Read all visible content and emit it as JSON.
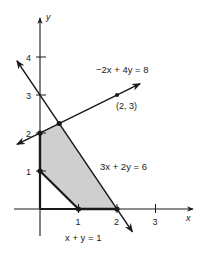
{
  "diagram": {
    "type": "linear-programming-feasible-region",
    "axes": {
      "x_label": "x",
      "y_label": "y",
      "x_range": [
        -0.6,
        3.6
      ],
      "y_range": [
        -1.0,
        5.0
      ],
      "x_ticks": [
        {
          "value": 1,
          "label": "1"
        },
        {
          "value": 2,
          "label": "2"
        },
        {
          "value": 3,
          "label": "3"
        }
      ],
      "y_ticks": [
        {
          "value": 1,
          "label": "1"
        },
        {
          "value": 2,
          "label": "2"
        },
        {
          "value": 3,
          "label": "3"
        },
        {
          "value": 4,
          "label": "4"
        }
      ]
    },
    "lines": [
      {
        "id": "line-neg2x-4y-8",
        "label": "−2x + 4y = 8",
        "a": -2,
        "b": 4,
        "c": 8,
        "from": [
          -0.6,
          1.7
        ],
        "to": [
          2.6,
          3.3
        ],
        "arrows": "both"
      },
      {
        "id": "line-3x-2y-6",
        "label": "3x + 2y = 6",
        "a": 3,
        "b": 2,
        "c": 6,
        "from": [
          -0.6,
          3.9
        ],
        "to": [
          2.4,
          -0.6
        ],
        "arrows": "both"
      },
      {
        "id": "line-x-y-1",
        "label": "x + y = 1",
        "a": 1,
        "b": 1,
        "c": 1,
        "from": [
          0,
          1
        ],
        "to": [
          1,
          0
        ],
        "arrows": "none"
      }
    ],
    "feasible_region": {
      "fill": "#cfcfcf",
      "vertices": [
        [
          0,
          1
        ],
        [
          0,
          2
        ],
        [
          0.5,
          2.25
        ],
        [
          2,
          0
        ],
        [
          1,
          0
        ]
      ]
    },
    "points": [
      {
        "label": "(2, 3)",
        "x": 2,
        "y": 3
      },
      {
        "label": "",
        "x": 0,
        "y": 1
      },
      {
        "label": "",
        "x": 0,
        "y": 2
      },
      {
        "label": "",
        "x": 0.5,
        "y": 2.25
      },
      {
        "label": "",
        "x": 1,
        "y": 0
      },
      {
        "label": "",
        "x": 2,
        "y": 0
      }
    ],
    "colors": {
      "ink": "#1a1a1a",
      "region": "#cfcfcf"
    }
  }
}
